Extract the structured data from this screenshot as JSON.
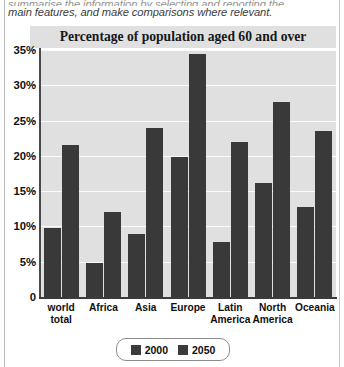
{
  "prompt": {
    "line_clipped": "summarise the information by selecting and reporting the",
    "line_visible": "main features, and make comparisons where relevant."
  },
  "figure": {
    "legend": {
      "entries": [
        {
          "label": "2000",
          "color": "#3b3b3b"
        },
        {
          "label": "2050",
          "color": "#3b3b3b"
        }
      ]
    }
  },
  "chart_data": {
    "type": "bar",
    "title": "Percentage of population aged 60 and over",
    "xlabel": "",
    "ylabel": "",
    "ylim": [
      0,
      35
    ],
    "ytick_labels": [
      "35%",
      "30%",
      "25%",
      "20%",
      "15%",
      "10%",
      "5%",
      "0"
    ],
    "ytick_values": [
      35,
      30,
      25,
      20,
      15,
      10,
      5,
      0
    ],
    "grid": true,
    "legend_position": "bottom-center",
    "bar_color": "#393939",
    "plot_background": "#e0e0e0",
    "categories": [
      "world total",
      "Africa",
      "Asia",
      "Europe",
      "Latin America",
      "North America",
      "Oceania"
    ],
    "series": [
      {
        "name": "2000",
        "values": [
          9.8,
          4.8,
          9.0,
          19.8,
          7.8,
          16.2,
          12.8
        ]
      },
      {
        "name": "2050",
        "values": [
          21.5,
          12.1,
          24.0,
          34.5,
          22.0,
          27.6,
          23.5
        ]
      }
    ]
  }
}
